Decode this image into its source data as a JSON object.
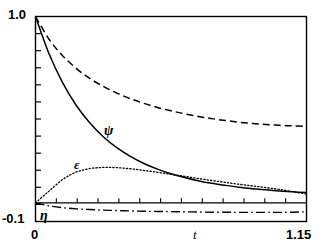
{
  "figure": {
    "background_color": "#ffffff",
    "ink_color": "#000000",
    "width": 329,
    "height": 249
  },
  "axes": {
    "y_max_label": "1.0",
    "y_min_label": "-0.1",
    "x_min_label": "0",
    "x_max_label": "1.15",
    "x_axis_name": "t",
    "y_tick_count": 11,
    "zero_line_tick_count": 12
  },
  "curve_labels": {
    "psi": "ψ",
    "epsilon": "ε",
    "eta": "η"
  },
  "chart_data": {
    "type": "line",
    "title": "",
    "subtitle": "",
    "xlabel": "t",
    "ylabel": "",
    "xlim": [
      0,
      1.15
    ],
    "ylim": [
      -0.1,
      1.0
    ],
    "grid": false,
    "legend_position": "inline-annotations",
    "annotations": [
      {
        "text": "ψ",
        "x": 0.31,
        "y": 0.46,
        "series": "psi"
      },
      {
        "text": "ε",
        "x": 0.18,
        "y": 0.21,
        "series": "epsilon"
      },
      {
        "text": "η",
        "x": 0.04,
        "y": -0.045,
        "series": "eta"
      }
    ],
    "x": [
      0.0,
      0.0575,
      0.115,
      0.1725,
      0.23,
      0.2875,
      0.345,
      0.4025,
      0.46,
      0.5175,
      0.575,
      0.6325,
      0.69,
      0.7475,
      0.805,
      0.8625,
      0.92,
      0.9775,
      1.035,
      1.0925,
      1.15
    ],
    "series": [
      {
        "name": "psi",
        "label": "ψ",
        "style": "solid",
        "values": [
          1.0,
          0.8,
          0.645,
          0.524,
          0.43,
          0.355,
          0.296,
          0.249,
          0.211,
          0.181,
          0.156,
          0.136,
          0.119,
          0.105,
          0.094,
          0.084,
          0.076,
          0.07,
          0.064,
          0.059,
          0.055
        ]
      },
      {
        "name": "upper-dashed",
        "label": "",
        "style": "dashed",
        "values": [
          1.0,
          0.878,
          0.79,
          0.722,
          0.668,
          0.625,
          0.589,
          0.559,
          0.534,
          0.512,
          0.494,
          0.478,
          0.464,
          0.452,
          0.442,
          0.433,
          0.426,
          0.42,
          0.416,
          0.413,
          0.411
        ]
      },
      {
        "name": "epsilon",
        "label": "ε",
        "style": "dotted",
        "values": [
          0.0,
          0.063,
          0.125,
          0.165,
          0.184,
          0.19,
          0.189,
          0.183,
          0.174,
          0.164,
          0.153,
          0.142,
          0.131,
          0.12,
          0.11,
          0.1,
          0.091,
          0.082,
          0.072,
          0.06,
          0.047
        ]
      },
      {
        "name": "eta",
        "label": "η",
        "style": "dash-dot",
        "values": [
          0.0,
          -0.016,
          -0.026,
          -0.032,
          -0.036,
          -0.039,
          -0.041,
          -0.043,
          -0.045,
          -0.046,
          -0.047,
          -0.048,
          -0.049,
          -0.05,
          -0.05,
          -0.051,
          -0.051,
          -0.051,
          -0.051,
          -0.05,
          -0.048
        ]
      }
    ]
  }
}
